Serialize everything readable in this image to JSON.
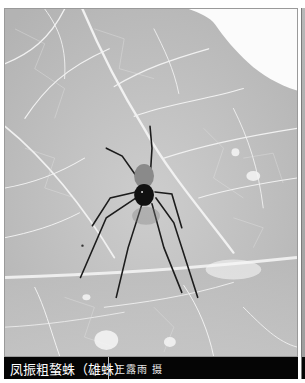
{
  "figure": {
    "caption": {
      "species": "凤振粗螯蛛（雄蛛）",
      "credit": "王露雨 摄"
    },
    "colors": {
      "caption_bg": "#050505",
      "caption_text": "#ffffff",
      "leaf_gray": "#c4c4c4",
      "vein": "#f2f2f2",
      "spider": "#141414"
    }
  }
}
